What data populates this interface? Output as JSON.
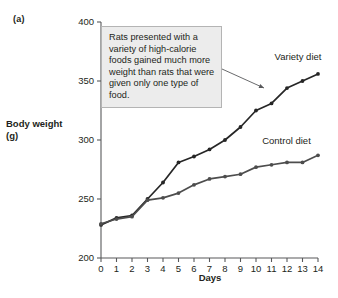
{
  "panel": {
    "label": "(a)"
  },
  "callout": {
    "text": "Rats presented with a variety of high-calorie foods gained much more weight than rats that were given only one type of food."
  },
  "colors": {
    "variety": "#262626",
    "control": "#4d4d4d",
    "axis": "#58595b",
    "text": "#231f20",
    "callout_bg": "#ececec",
    "callout_border": "#b4b4b4"
  },
  "chart_data": {
    "type": "line",
    "title": "",
    "xlabel": "Days",
    "ylabel": "Body weight (g)",
    "xlim": [
      0,
      14
    ],
    "ylim": [
      200,
      400
    ],
    "xticks": [
      0,
      1,
      2,
      3,
      4,
      5,
      6,
      7,
      8,
      9,
      10,
      11,
      12,
      13,
      14
    ],
    "yticks": [
      200,
      250,
      300,
      350,
      400
    ],
    "xtick_labels": [
      "0",
      "1",
      "2",
      "3",
      "4",
      "5",
      "6",
      "7",
      "8",
      "9",
      "10",
      "11",
      "12",
      "13",
      "14"
    ],
    "ytick_labels": [
      "200",
      "250",
      "300",
      "350",
      "400"
    ],
    "grid": false,
    "legend_position": "inline-right",
    "x": [
      0,
      1,
      2,
      3,
      4,
      5,
      6,
      7,
      8,
      9,
      10,
      11,
      12,
      13,
      14
    ],
    "series": [
      {
        "name": "Variety diet",
        "color": "#262626",
        "label_x": 11.2,
        "label_y": 368,
        "values": [
          228,
          234,
          236,
          250,
          264,
          281,
          286,
          292,
          300,
          311,
          325,
          331,
          344,
          350,
          356
        ]
      },
      {
        "name": "Control diet",
        "color": "#4d4d4d",
        "label_x": 10.4,
        "label_y": 297,
        "values": [
          229,
          233,
          235,
          249,
          251,
          255,
          262,
          267,
          269,
          271,
          277,
          279,
          281,
          281,
          287
        ]
      }
    ]
  }
}
